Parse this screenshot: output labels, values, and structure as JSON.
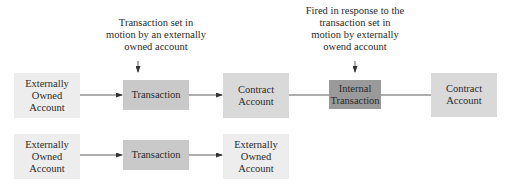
{
  "diagram": {
    "row1": {
      "nodes": [
        {
          "id": "eoa1",
          "label": "Externally\nOwned\nAccount",
          "shade": "#ededed"
        },
        {
          "id": "tx1",
          "label": "Transaction",
          "shade": "#c9c9c9"
        },
        {
          "id": "ca1",
          "label": "Contract\nAccount",
          "shade": "#d9d9d9"
        },
        {
          "id": "itx",
          "label": "Internal\nTransaction",
          "shade": "#9a9a9a"
        },
        {
          "id": "ca2",
          "label": "Contract\nAccount",
          "shade": "#d9d9d9"
        }
      ],
      "edges": [
        {
          "from": "eoa1",
          "to": "tx1",
          "arrow": true
        },
        {
          "from": "tx1",
          "to": "ca1",
          "arrow": true
        },
        {
          "from": "ca1",
          "to": "itx",
          "arrow": false
        },
        {
          "from": "itx",
          "to": "ca2",
          "arrow": false
        }
      ]
    },
    "row2": {
      "nodes": [
        {
          "id": "eoa2",
          "label": "Externally\nOwned\nAccount",
          "shade": "#ededed"
        },
        {
          "id": "tx2",
          "label": "Transaction",
          "shade": "#c9c9c9"
        },
        {
          "id": "eoa3",
          "label": "Externally\nOwned\nAccount",
          "shade": "#ededed"
        }
      ],
      "edges": [
        {
          "from": "eoa2",
          "to": "tx2",
          "arrow": true
        },
        {
          "from": "tx2",
          "to": "eoa3",
          "arrow": true
        }
      ]
    },
    "annotations": [
      {
        "target": "tx1",
        "text": "Transaction set in\nmotion by an externally\nowned account"
      },
      {
        "target": "itx",
        "text": "Fired in response to the\ntransaction set in\nmotion by externally\nowend account"
      }
    ]
  }
}
